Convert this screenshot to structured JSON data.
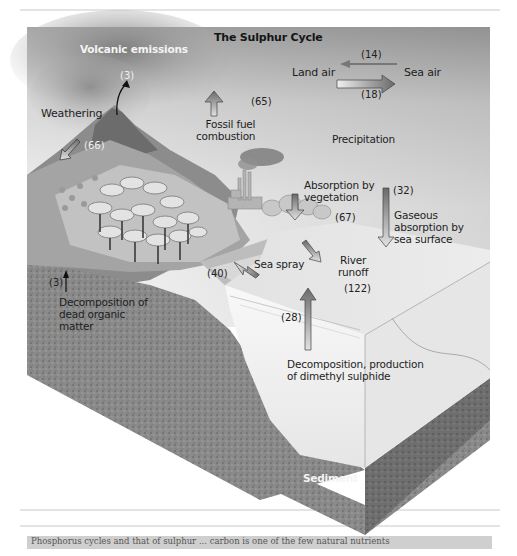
{
  "diagram": {
    "title": "The Sulphur Cycle",
    "labels": {
      "volcanic_emissions": "Volcanic emissions",
      "weathering": "Weathering",
      "fossil_fuel": "Fossil fuel",
      "combustion": "combustion",
      "land_air": "Land air",
      "sea_air": "Sea air",
      "precipitation": "Precipitation",
      "absorption_veg_1": "Absorption by",
      "absorption_veg_2": "vegetation",
      "gaseous_1": "Gaseous",
      "gaseous_2": "absorption by",
      "gaseous_3": "sea surface",
      "sea_spray": "Sea spray",
      "river_1": "River",
      "river_2": "runoff",
      "decomp_dead_1": "Decomposition of",
      "decomp_dead_2": "dead organic",
      "decomp_dead_3": "matter",
      "decomp_dms_1": "Decomposition, production",
      "decomp_dms_2": "of dimethyl sulphide",
      "sediment": "Sediment"
    },
    "flows": {
      "volcanic": "(3)",
      "land_to_sea_air": "(18)",
      "sea_to_land_air": "(14)",
      "fossil_fuel": "(65)",
      "weathering": "(66)",
      "vegetation": "(67)",
      "gaseous_absorption": "(32)",
      "river_runoff": "(122)",
      "sea_spray": "(40)",
      "dms": "(28)",
      "dead_organic": "(3)"
    },
    "bottom_strip_text": "Phosphorus cycles and that of sulphur ... carbon is one of the few natural nutrients"
  },
  "colors": {
    "sky_top": "#8e8e8e",
    "sky_light": "#e9e9e9",
    "ground": "#7a7a7a",
    "sea": "#f2f2f2",
    "arrow_dark": "#6e6e6e",
    "arrow_light": "#dcdcdc"
  }
}
